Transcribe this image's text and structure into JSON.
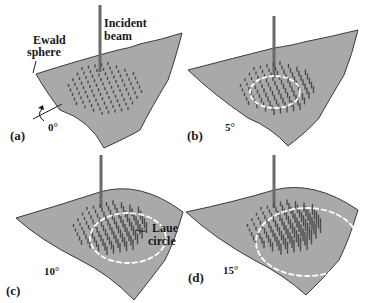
{
  "figure": {
    "panels": [
      {
        "id": "a",
        "label": "(a)",
        "angle": "0°",
        "angle_deg": 0,
        "laue_circle": false
      },
      {
        "id": "b",
        "label": "(b)",
        "angle": "5°",
        "angle_deg": 5,
        "laue_circle": true
      },
      {
        "id": "c",
        "label": "(c)",
        "angle": "10°",
        "angle_deg": 10,
        "laue_circle": true
      },
      {
        "id": "d",
        "label": "(d)",
        "angle": "15°",
        "angle_deg": 15,
        "laue_circle": true
      }
    ],
    "annotations": {
      "ewald_line1": "Ewald",
      "ewald_line2": "sphere",
      "incident_line1": "Incident",
      "incident_line2": "beam",
      "laue_line1": "Laue",
      "laue_line2": "circle"
    },
    "colors": {
      "sheet": "#a9a9a9",
      "sheet_edge": "#3a3a3a",
      "spike": "#4a4a4a",
      "beam": "#6a6a6a",
      "laue": "#ffffff",
      "text": "#1a1a1a"
    }
  }
}
